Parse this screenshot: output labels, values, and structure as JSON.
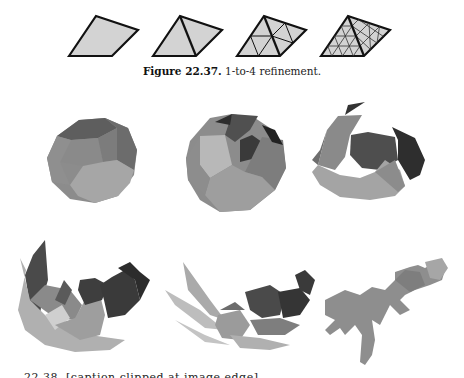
{
  "figure_top": {
    "caption_label": "Figure 22.37.",
    "caption_text": " 1-to-4 refinement.",
    "fill_color": "#d3d3d3",
    "stroke_color": "#111111",
    "panels": [
      {
        "name": "level-0",
        "subdivisions": 1
      },
      {
        "name": "level-1",
        "subdivisions": 2
      },
      {
        "name": "level-2",
        "subdivisions": 4
      },
      {
        "name": "level-3",
        "subdivisions": 8
      }
    ]
  },
  "figure_bottom": {
    "panels": [
      {
        "name": "truncated-polyhedron-closed"
      },
      {
        "name": "polyhedron-opening"
      },
      {
        "name": "polyhedron-unfolding"
      },
      {
        "name": "polyhedron-half-unfolded"
      },
      {
        "name": "polyhedron-mostly-flat"
      },
      {
        "name": "polyhedron-flat-net"
      }
    ],
    "caption_clipped": "22.38. [caption clipped at image edge]"
  }
}
